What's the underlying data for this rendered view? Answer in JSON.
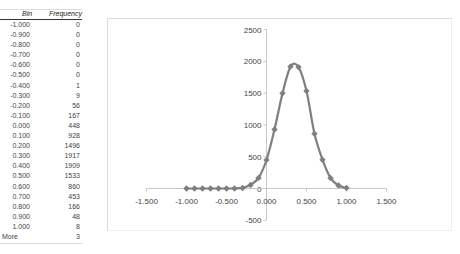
{
  "table": {
    "headers": {
      "bin": "Bin",
      "frequency": "Frequency"
    },
    "rows": [
      {
        "bin": "-1.000",
        "frequency": "0"
      },
      {
        "bin": "-0.900",
        "frequency": "0"
      },
      {
        "bin": "-0.800",
        "frequency": "0"
      },
      {
        "bin": "-0.700",
        "frequency": "0"
      },
      {
        "bin": "-0.600",
        "frequency": "0"
      },
      {
        "bin": "-0.500",
        "frequency": "0"
      },
      {
        "bin": "-0.400",
        "frequency": "1"
      },
      {
        "bin": "-0.300",
        "frequency": "9"
      },
      {
        "bin": "-0.200",
        "frequency": "56"
      },
      {
        "bin": "-0.100",
        "frequency": "167"
      },
      {
        "bin": "0.000",
        "frequency": "448"
      },
      {
        "bin": "0.100",
        "frequency": "928"
      },
      {
        "bin": "0.200",
        "frequency": "1496"
      },
      {
        "bin": "0.300",
        "frequency": "1917"
      },
      {
        "bin": "0.400",
        "frequency": "1909"
      },
      {
        "bin": "0.500",
        "frequency": "1533"
      },
      {
        "bin": "0.600",
        "frequency": "860"
      },
      {
        "bin": "0.700",
        "frequency": "453"
      },
      {
        "bin": "0.800",
        "frequency": "166"
      },
      {
        "bin": "0.900",
        "frequency": "48"
      },
      {
        "bin": "1.000",
        "frequency": "8"
      },
      {
        "bin": "More",
        "frequency": "3"
      }
    ]
  },
  "chart_data": {
    "type": "scatter",
    "title": "",
    "xlabel": "",
    "ylabel": "",
    "xlim": [
      -1.5,
      1.5
    ],
    "ylim": [
      -500,
      2500
    ],
    "x_ticks": [
      "-1.500",
      "-1.000",
      "-0.500",
      "0.000",
      "0.500",
      "1.000",
      "1.500"
    ],
    "y_ticks": [
      "-500",
      "0",
      "500",
      "1000",
      "1500",
      "2000",
      "2500"
    ],
    "grid": false,
    "legend": null,
    "series": [
      {
        "name": "Frequency",
        "style": "smooth line with diamond markers",
        "color": "#7f7f7f",
        "x": [
          -1.0,
          -0.9,
          -0.8,
          -0.7,
          -0.6,
          -0.5,
          -0.4,
          -0.3,
          -0.2,
          -0.1,
          0.0,
          0.1,
          0.2,
          0.3,
          0.4,
          0.5,
          0.6,
          0.7,
          0.8,
          0.9,
          1.0
        ],
        "y": [
          0,
          0,
          0,
          0,
          0,
          0,
          1,
          9,
          56,
          167,
          448,
          928,
          1496,
          1917,
          1909,
          1533,
          860,
          453,
          166,
          48,
          8
        ]
      }
    ]
  }
}
